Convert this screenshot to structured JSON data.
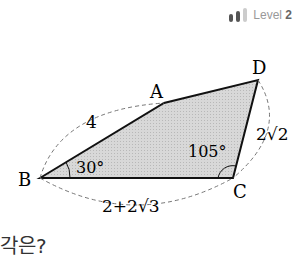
{
  "level": {
    "label": "Level",
    "number": "2"
  },
  "diagram": {
    "vertices": {
      "A": "A",
      "B": "B",
      "C": "C",
      "D": "D"
    },
    "lengths": {
      "AB": "4",
      "CD": "2√2",
      "BC": "2+2√3"
    },
    "angles": {
      "B": "30°",
      "C": "105°"
    },
    "fill_color": "#d4d4d4"
  },
  "cut_text": "각은?"
}
